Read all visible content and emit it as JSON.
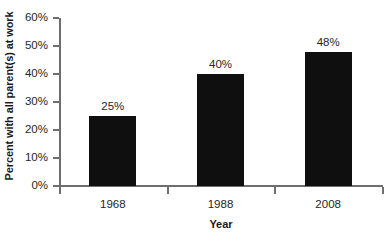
{
  "chart_data": {
    "type": "bar",
    "title": "",
    "categories": [
      "1968",
      "1988",
      "2008"
    ],
    "values": [
      25,
      40,
      48
    ],
    "data_labels": [
      "25%",
      "40%",
      "48%"
    ],
    "series": [
      {
        "name": "Percent with all parent(s) at work",
        "values": [
          25,
          40,
          48
        ]
      }
    ],
    "xlabel": "Year",
    "ylabel": "Percent with all parent(s) at work",
    "ylim": [
      0,
      60
    ],
    "ytick_labels": [
      "0%",
      "10%",
      "20%",
      "30%",
      "40%",
      "50%",
      "60%"
    ],
    "ytick_values": [
      0,
      10,
      20,
      30,
      40,
      50,
      60
    ],
    "grid": false,
    "legend": false,
    "bar_color": "#0f0f0f",
    "axis_color": "#6e6e6e",
    "background_color": "#ffffff"
  }
}
